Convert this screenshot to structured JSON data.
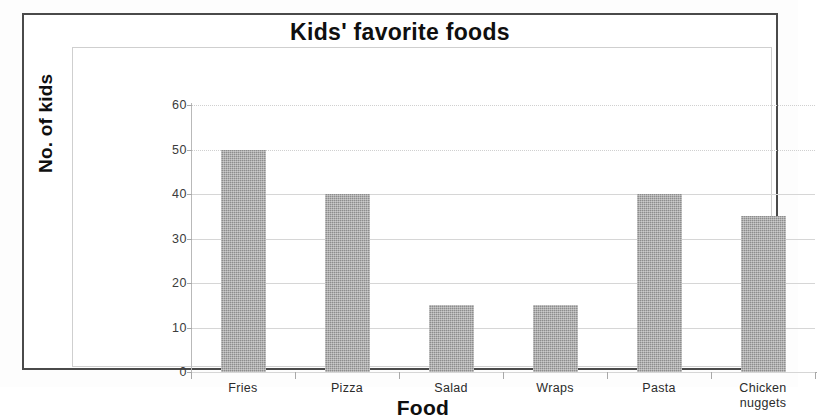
{
  "chart_data": {
    "type": "bar",
    "title": "Kids' favorite foods",
    "xlabel": "Food",
    "ylabel": "No. of kids",
    "categories": [
      "Fries",
      "Pizza",
      "Salad",
      "Wraps",
      "Pasta",
      "Chicken nuggets"
    ],
    "category_label_lines": [
      [
        "Fries"
      ],
      [
        "Pizza"
      ],
      [
        "Salad"
      ],
      [
        "Wraps"
      ],
      [
        "Pasta"
      ],
      [
        "Chicken",
        "nuggets"
      ]
    ],
    "values": [
      50,
      40,
      15,
      15,
      40,
      35
    ],
    "ylim": [
      0,
      60
    ],
    "ytick_values": [
      0,
      10,
      20,
      30,
      40,
      50,
      60
    ],
    "ytick_labels": [
      "0",
      "10",
      "20",
      "30",
      "40",
      "50",
      "60"
    ],
    "grid": true,
    "legend": "none",
    "bar_color": "#8d8d8d",
    "gridline_color": "#d6d6d6",
    "axis_color": "#a8a8a8",
    "frame_color": "#4a4a4a",
    "plot_border_color": "#cfcfcf",
    "background_color": "#ffffff",
    "text_color": "#0f0f0f"
  }
}
